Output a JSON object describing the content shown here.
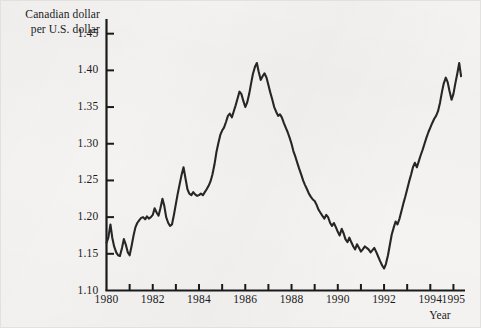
{
  "figure": {
    "background_color": "#f4f3f2",
    "line_color": "#262626",
    "axis_color": "#1a1a1a"
  },
  "axis_title": {
    "y_line_1": "Canadian dollar",
    "y_line_2": "per U.S. dollar",
    "x_title": "Year"
  },
  "chart_data": {
    "type": "line",
    "title": "",
    "subtitle": "",
    "xlabel": "Year",
    "ylabel": "Canadian dollar per U.S. dollar",
    "xlim": [
      1980.0,
      1995.5
    ],
    "ylim": [
      1.1,
      1.47
    ],
    "ytick_values": [
      1.1,
      1.15,
      1.2,
      1.25,
      1.3,
      1.35,
      1.4,
      1.45
    ],
    "ytick_labels": [
      "1.10",
      "1.15",
      "1.20",
      "1.25",
      "1.30",
      "1.35",
      "1.40",
      "1.45"
    ],
    "xtick_values": [
      1980,
      1981,
      1982,
      1983,
      1984,
      1985,
      1986,
      1987,
      1988,
      1989,
      1990,
      1991,
      1992,
      1993,
      1994,
      1995
    ],
    "xtick_labels_shown": [
      "1980",
      "1982",
      "1984",
      "1986",
      "1988",
      "1990",
      "1992",
      "1994",
      "1995"
    ],
    "xtick_labeled_values": [
      1980,
      1982,
      1984,
      1986,
      1988,
      1990,
      1992,
      1994,
      1995
    ],
    "grid": false,
    "legend": false,
    "legend_position": "none",
    "series": [
      {
        "name": "Canadian dollar per U.S. dollar",
        "color": "#262626",
        "x": [
          1980.0,
          1980.08,
          1980.17,
          1980.25,
          1980.33,
          1980.42,
          1980.5,
          1980.58,
          1980.67,
          1980.75,
          1980.83,
          1980.92,
          1981.0,
          1981.08,
          1981.17,
          1981.25,
          1981.33,
          1981.42,
          1981.5,
          1981.58,
          1981.67,
          1981.75,
          1981.83,
          1981.92,
          1982.0,
          1982.08,
          1982.17,
          1982.25,
          1982.33,
          1982.42,
          1982.5,
          1982.58,
          1982.67,
          1982.75,
          1982.83,
          1982.92,
          1983.0,
          1983.08,
          1983.17,
          1983.25,
          1983.33,
          1983.42,
          1983.5,
          1983.58,
          1983.67,
          1983.75,
          1983.83,
          1983.92,
          1984.0,
          1984.08,
          1984.17,
          1984.25,
          1984.33,
          1984.42,
          1984.5,
          1984.58,
          1984.67,
          1984.75,
          1984.83,
          1984.92,
          1985.0,
          1985.08,
          1985.17,
          1985.25,
          1985.33,
          1985.42,
          1985.5,
          1985.58,
          1985.67,
          1985.75,
          1985.83,
          1985.92,
          1986.0,
          1986.08,
          1986.17,
          1986.25,
          1986.33,
          1986.42,
          1986.5,
          1986.58,
          1986.67,
          1986.75,
          1986.83,
          1986.92,
          1987.0,
          1987.08,
          1987.17,
          1987.25,
          1987.33,
          1987.42,
          1987.5,
          1987.58,
          1987.67,
          1987.75,
          1987.83,
          1987.92,
          1988.0,
          1988.08,
          1988.17,
          1988.25,
          1988.33,
          1988.42,
          1988.5,
          1988.58,
          1988.67,
          1988.75,
          1988.83,
          1988.92,
          1989.0,
          1989.08,
          1989.17,
          1989.25,
          1989.33,
          1989.42,
          1989.5,
          1989.58,
          1989.67,
          1989.75,
          1989.83,
          1989.92,
          1990.0,
          1990.08,
          1990.17,
          1990.25,
          1990.33,
          1990.42,
          1990.5,
          1990.58,
          1990.67,
          1990.75,
          1990.83,
          1990.92,
          1991.0,
          1991.08,
          1991.17,
          1991.25,
          1991.33,
          1991.42,
          1991.5,
          1991.58,
          1991.67,
          1991.75,
          1991.83,
          1991.92,
          1992.0,
          1992.08,
          1992.17,
          1992.25,
          1992.33,
          1992.42,
          1992.5,
          1992.58,
          1992.67,
          1992.75,
          1992.83,
          1992.92,
          1993.0,
          1993.08,
          1993.17,
          1993.25,
          1993.33,
          1993.42,
          1993.5,
          1993.58,
          1993.67,
          1993.75,
          1993.83,
          1993.92,
          1994.0,
          1994.08,
          1994.17,
          1994.25,
          1994.33,
          1994.42,
          1994.5,
          1994.58,
          1994.67,
          1994.75,
          1994.83,
          1994.92,
          1995.0,
          1995.08,
          1995.17,
          1995.25,
          1995.33
        ],
        "y": [
          1.165,
          1.172,
          1.19,
          1.172,
          1.16,
          1.152,
          1.148,
          1.147,
          1.158,
          1.17,
          1.163,
          1.152,
          1.148,
          1.16,
          1.175,
          1.186,
          1.192,
          1.196,
          1.199,
          1.2,
          1.197,
          1.201,
          1.198,
          1.2,
          1.203,
          1.212,
          1.206,
          1.202,
          1.212,
          1.225,
          1.215,
          1.2,
          1.192,
          1.188,
          1.19,
          1.204,
          1.218,
          1.232,
          1.246,
          1.258,
          1.268,
          1.252,
          1.238,
          1.232,
          1.23,
          1.234,
          1.231,
          1.229,
          1.23,
          1.232,
          1.23,
          1.234,
          1.238,
          1.243,
          1.249,
          1.258,
          1.272,
          1.288,
          1.3,
          1.312,
          1.318,
          1.322,
          1.33,
          1.338,
          1.341,
          1.336,
          1.344,
          1.352,
          1.362,
          1.371,
          1.368,
          1.358,
          1.35,
          1.356,
          1.368,
          1.382,
          1.395,
          1.405,
          1.41,
          1.398,
          1.387,
          1.392,
          1.396,
          1.39,
          1.38,
          1.37,
          1.36,
          1.35,
          1.344,
          1.338,
          1.34,
          1.336,
          1.328,
          1.322,
          1.316,
          1.308,
          1.3,
          1.29,
          1.282,
          1.274,
          1.266,
          1.258,
          1.25,
          1.244,
          1.238,
          1.232,
          1.228,
          1.224,
          1.222,
          1.217,
          1.21,
          1.206,
          1.202,
          1.198,
          1.203,
          1.2,
          1.192,
          1.188,
          1.192,
          1.186,
          1.18,
          1.175,
          1.184,
          1.178,
          1.17,
          1.166,
          1.172,
          1.166,
          1.16,
          1.156,
          1.163,
          1.158,
          1.153,
          1.156,
          1.16,
          1.158,
          1.156,
          1.152,
          1.155,
          1.158,
          1.152,
          1.146,
          1.14,
          1.134,
          1.13,
          1.136,
          1.148,
          1.162,
          1.176,
          1.186,
          1.194,
          1.19,
          1.198,
          1.208,
          1.218,
          1.228,
          1.238,
          1.248,
          1.258,
          1.268,
          1.274,
          1.268,
          1.276,
          1.284,
          1.292,
          1.3,
          1.308,
          1.316,
          1.322,
          1.328,
          1.334,
          1.338,
          1.344,
          1.356,
          1.37,
          1.382,
          1.39,
          1.384,
          1.372,
          1.36,
          1.368,
          1.382,
          1.396,
          1.41,
          1.392
        ]
      }
    ]
  }
}
